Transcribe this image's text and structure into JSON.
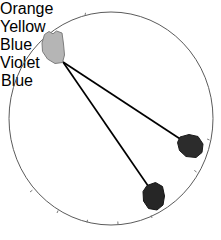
{
  "figure": {
    "type": "chromaticity-diagram",
    "background_color": "#ffffff",
    "boundary": {
      "name": "spectrum-locus-circle",
      "stroke_color": "#5b5b5b",
      "center": [
        111,
        118
      ],
      "radius_x": 102,
      "radius_y": 106
    },
    "convergence_point": [
      63,
      62
    ]
  },
  "samples": [
    {
      "id": "orange-yellow",
      "label_line1": "Orange",
      "label_line2": "Yellow",
      "fill_color": "#b3b3b3",
      "stroke_color": "#7a7a7a",
      "center": [
        52,
        47
      ]
    },
    {
      "id": "blue",
      "label_line1": "Blue",
      "label_line2": "",
      "fill_color": "#2b2b2b",
      "stroke_color": "#1a1a1a",
      "center": [
        190,
        146
      ]
    },
    {
      "id": "violet-blue",
      "label_line1": "Violet",
      "label_line2": "Blue",
      "fill_color": "#262626",
      "stroke_color": "#141414",
      "center": [
        153,
        196
      ]
    }
  ],
  "connector_lines": [
    {
      "id": "line-to-blue",
      "from": [
        63,
        62
      ],
      "to": [
        180,
        139
      ],
      "stroke_color": "#000000"
    },
    {
      "id": "line-to-violet-blue",
      "from": [
        63,
        62
      ],
      "to": [
        148,
        186
      ],
      "stroke_color": "#000000"
    }
  ],
  "tick_marks": {
    "name": "locus-wavelength-ticks",
    "color": "#777777",
    "count": 8
  }
}
